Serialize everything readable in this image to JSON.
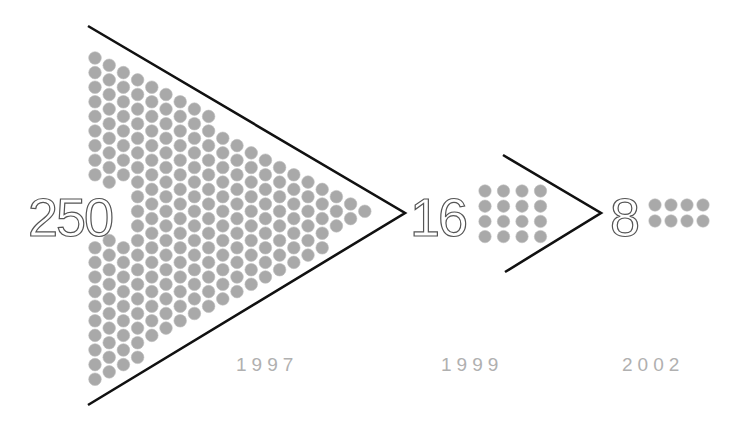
{
  "diagram": {
    "title": "",
    "colors": {
      "dot": "#a9a9a9",
      "dot_stroke": "#bdbdbd",
      "line": "#111111",
      "number_stroke": "#555555",
      "year": "#b0b0b0"
    },
    "stages": [
      {
        "count": "250",
        "year": "1997"
      },
      {
        "count": "16",
        "year": "1999"
      },
      {
        "count": "8",
        "year": "2002"
      }
    ]
  },
  "chart_data": {
    "type": "pictograph",
    "title": "",
    "categories": [
      "1997",
      "1999",
      "2002"
    ],
    "values": [
      250,
      16,
      8
    ],
    "xlabel": "",
    "ylabel": "",
    "annotations": [
      "250",
      "16",
      "8"
    ]
  }
}
